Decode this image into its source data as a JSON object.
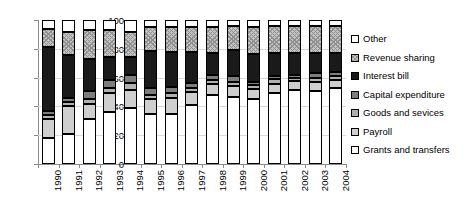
{
  "chart_data": {
    "type": "bar",
    "stacked": true,
    "stack_total": 100,
    "title": "",
    "xlabel": "",
    "ylabel": "",
    "ylim": [
      0,
      100
    ],
    "yticks": [
      0,
      20,
      40,
      60,
      80,
      100
    ],
    "grid": true,
    "legend_position": "right",
    "categories": [
      "1990",
      "1991",
      "1992",
      "1993",
      "1994",
      "1995",
      "1996",
      "1997",
      "1998",
      "1999",
      "2000",
      "2001",
      "2002",
      "2003",
      "2004"
    ],
    "series": [
      {
        "name": "Grants and transfers",
        "color": "#ffffff",
        "pattern": "solid",
        "values": [
          18.0,
          20.5,
          31.0,
          36.0,
          39.0,
          34.5,
          34.5,
          41.0,
          48.0,
          46.5,
          45.0,
          49.0,
          51.5,
          50.5,
          52.5
        ]
      },
      {
        "name": "Payroll",
        "color": "#cfcfcf",
        "pattern": "solid",
        "values": [
          13.0,
          19.5,
          10.5,
          13.0,
          12.5,
          10.5,
          11.0,
          9.0,
          7.5,
          7.5,
          7.0,
          6.5,
          6.0,
          6.5,
          6.0
        ]
      },
      {
        "name": "Goods and sevices",
        "color": "#b0b0b0",
        "pattern": "solid",
        "values": [
          3.0,
          3.0,
          3.5,
          4.0,
          4.5,
          3.0,
          3.5,
          3.0,
          2.5,
          3.0,
          3.0,
          3.5,
          2.5,
          3.0,
          2.5
        ]
      },
      {
        "name": "Capital expenditure",
        "color": "#7d7d7d",
        "pattern": "solid",
        "values": [
          2.5,
          3.0,
          6.0,
          5.5,
          5.5,
          5.0,
          4.5,
          3.0,
          3.5,
          4.0,
          2.0,
          2.0,
          2.0,
          3.0,
          3.0
        ]
      },
      {
        "name": "Interest bill",
        "color": "#1a1a1a",
        "pattern": "solid",
        "values": [
          44.5,
          29.5,
          22.0,
          15.5,
          13.0,
          25.5,
          24.5,
          22.0,
          15.5,
          18.0,
          19.5,
          16.0,
          15.0,
          14.0,
          13.0
        ]
      },
      {
        "name": "Revenue sharing",
        "color": "#c4c4c4",
        "pattern": "crosshatch",
        "values": [
          12.5,
          16.5,
          20.0,
          19.0,
          17.5,
          16.5,
          17.0,
          17.0,
          18.0,
          16.5,
          18.5,
          19.0,
          19.0,
          19.0,
          19.0
        ]
      },
      {
        "name": "Other",
        "color": "#ffffff",
        "pattern": "solid",
        "values": [
          6.5,
          8.0,
          7.0,
          7.0,
          8.0,
          5.0,
          5.0,
          5.0,
          5.0,
          4.5,
          5.0,
          4.0,
          4.0,
          4.0,
          4.0
        ]
      }
    ]
  },
  "legend": {
    "items": [
      {
        "label": "Other",
        "series_index": 6
      },
      {
        "label": "Revenue sharing",
        "series_index": 5
      },
      {
        "label": "Interest bill",
        "series_index": 4
      },
      {
        "label": "Capital expenditure",
        "series_index": 3
      },
      {
        "label": "Goods and sevices",
        "series_index": 2
      },
      {
        "label": "Payroll",
        "series_index": 1
      },
      {
        "label": "Grants and transfers",
        "series_index": 0
      }
    ]
  }
}
